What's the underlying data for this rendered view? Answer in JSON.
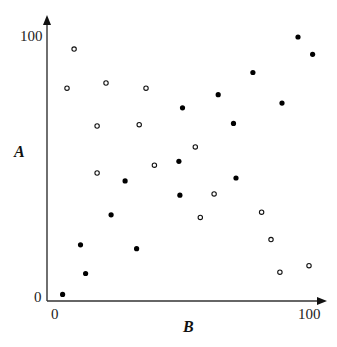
{
  "chart_data": {
    "type": "scatter",
    "title": "",
    "xlabel": "B",
    "ylabel": "A",
    "xlim": [
      0,
      100
    ],
    "ylim": [
      0,
      100
    ],
    "x_ticks": [
      "0",
      "100"
    ],
    "y_ticks": [
      "0",
      "100"
    ],
    "grid": false,
    "legend": null,
    "series": [
      {
        "name": "open",
        "marker": "open-circle",
        "color": "#111111",
        "points": [
          [
            7.5,
            95
          ],
          [
            4.7,
            80
          ],
          [
            20,
            82
          ],
          [
            35.7,
            80
          ],
          [
            16.5,
            65.5
          ],
          [
            33,
            66
          ],
          [
            16.5,
            47.5
          ],
          [
            39,
            50.5
          ],
          [
            55,
            57.5
          ],
          [
            62.4,
            39.5
          ],
          [
            57,
            30.5
          ],
          [
            81,
            32.5
          ],
          [
            84.7,
            22
          ],
          [
            88.2,
            9.5
          ],
          [
            99.6,
            12
          ]
        ]
      },
      {
        "name": "filled",
        "marker": "filled-circle",
        "color": "#000000",
        "points": [
          [
            3,
            1
          ],
          [
            10,
            20
          ],
          [
            12,
            9
          ],
          [
            22,
            31.5
          ],
          [
            32,
            18.5
          ],
          [
            27.5,
            44.5
          ],
          [
            49,
            39
          ],
          [
            48.6,
            52
          ],
          [
            50,
            72.5
          ],
          [
            64,
            77.5
          ],
          [
            70,
            66.5
          ],
          [
            71,
            45.6
          ],
          [
            77.6,
            86
          ],
          [
            95.3,
            99.6
          ],
          [
            101,
            93
          ],
          [
            89,
            74.3
          ]
        ]
      }
    ]
  },
  "axes": {
    "x_label": "B",
    "y_label": "A",
    "x_min_label": "0",
    "x_max_label": "100",
    "y_min_label": "0",
    "y_max_label": "100"
  }
}
